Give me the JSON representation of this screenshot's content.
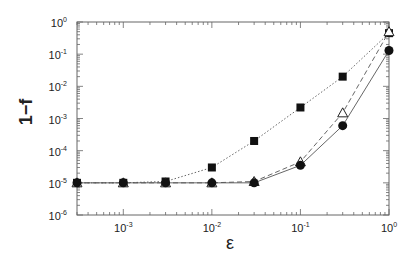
{
  "chart_data": {
    "type": "line",
    "title": "",
    "xlabel": "ε",
    "ylabel": "1−f",
    "xscale": "log",
    "yscale": "log",
    "xlim": [
      0.0003,
      1
    ],
    "ylim": [
      1e-06,
      1
    ],
    "grid": false,
    "legend": null,
    "x_ticks": [
      "10^-3",
      "10^-2",
      "10^-1",
      "10^0"
    ],
    "y_ticks": [
      "10^-6",
      "10^-5",
      "10^-4",
      "10^-3",
      "10^-2",
      "10^-1",
      "10^0"
    ],
    "x": [
      0.0003,
      0.001,
      0.003,
      0.01,
      0.03,
      0.1,
      0.3,
      1.0
    ],
    "series": [
      {
        "name": "filled squares (dotted)",
        "marker": "square-filled",
        "line": "dotted",
        "values": [
          1e-05,
          1e-05,
          1.1e-05,
          3e-05,
          0.0002,
          0.0022,
          0.02,
          0.45
        ]
      },
      {
        "name": "open triangles (dashed)",
        "marker": "triangle-open",
        "line": "dashed",
        "values": [
          1e-05,
          1e-05,
          1e-05,
          1e-05,
          1.1e-05,
          4.5e-05,
          0.0015,
          0.5
        ]
      },
      {
        "name": "filled circles (solid)",
        "marker": "circle-filled",
        "line": "solid",
        "values": [
          1e-05,
          1e-05,
          1e-05,
          1e-05,
          1e-05,
          3.5e-05,
          0.0006,
          0.13
        ]
      }
    ]
  },
  "labels": {
    "xlabel": "ε",
    "ylabel": "1−f",
    "x_ticks": [
      {
        "base": "10",
        "exp": "-3"
      },
      {
        "base": "10",
        "exp": "-2"
      },
      {
        "base": "10",
        "exp": "-1"
      },
      {
        "base": "10",
        "exp": "0"
      }
    ],
    "y_ticks": [
      {
        "base": "10",
        "exp": "0"
      },
      {
        "base": "10",
        "exp": "-1"
      },
      {
        "base": "10",
        "exp": "-2"
      },
      {
        "base": "10",
        "exp": "-3"
      },
      {
        "base": "10",
        "exp": "-4"
      },
      {
        "base": "10",
        "exp": "-5"
      },
      {
        "base": "10",
        "exp": "-6"
      }
    ]
  }
}
